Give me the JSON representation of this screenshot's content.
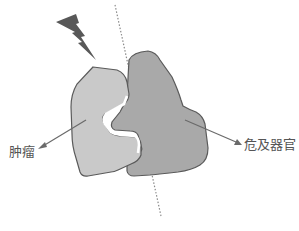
{
  "labels": {
    "tumor": "肿瘤",
    "organ_at_risk": "危及器官"
  },
  "icons": {
    "radiation_beam": "lightning-bolt-icon"
  },
  "colors": {
    "tumor_fill": "#c9c9c9",
    "organ_fill": "#a9a9a9",
    "outline": "#5a5a5a",
    "bolt": "#585858",
    "arrow": "#6a6a6a",
    "dotted_line": "#8a8a8a",
    "label_text": "#555555"
  }
}
